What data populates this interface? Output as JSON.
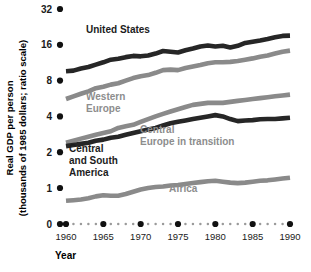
{
  "chart_data": {
    "type": "line",
    "title": "",
    "xlabel": "Year",
    "ylabel": "Real GDP per person (thousands of 1985 dollars; ratio scale)",
    "ylabel_line1": "Real GDP per person",
    "ylabel_line2": "(thousands of 1985 dollars; ratio scale)",
    "scale": "log2 (ratio scale)",
    "grid": false,
    "legend": "inline series labels",
    "xlim": [
      1960,
      1990
    ],
    "xticks": [
      1960,
      1965,
      1970,
      1975,
      1980,
      1985,
      1990
    ],
    "xticklabels": [
      "1960",
      "1965",
      "1970",
      "1975",
      "1980",
      "1985",
      "1990"
    ],
    "yticks": [
      0,
      1,
      2,
      4,
      8,
      16,
      32
    ],
    "yticklabels": [
      "0",
      "1",
      "2",
      "4",
      "8",
      "16",
      "32"
    ],
    "ylim": [
      0,
      32
    ],
    "x": [
      1960,
      1961,
      1962,
      1963,
      1964,
      1965,
      1966,
      1967,
      1968,
      1969,
      1970,
      1971,
      1972,
      1973,
      1974,
      1975,
      1976,
      1977,
      1978,
      1979,
      1980,
      1981,
      1982,
      1983,
      1984,
      1985,
      1986,
      1987,
      1988,
      1989,
      1990
    ],
    "series": [
      {
        "name": "United States",
        "color": "#262626",
        "label_color": "dark",
        "values": [
          9.6,
          9.7,
          10.1,
          10.4,
          10.9,
          11.4,
          12.0,
          12.2,
          12.6,
          12.9,
          12.8,
          13.0,
          13.5,
          14.2,
          14.0,
          13.8,
          14.4,
          14.9,
          15.5,
          15.8,
          15.5,
          15.7,
          15.2,
          15.7,
          16.6,
          17.0,
          17.4,
          17.9,
          18.5,
          19.0,
          19.1
        ]
      },
      {
        "name": "Western Europe",
        "color": "#8a8a8a",
        "label_color": "gray",
        "values": [
          5.6,
          5.9,
          6.2,
          6.5,
          6.9,
          7.1,
          7.4,
          7.6,
          8.0,
          8.4,
          8.7,
          8.9,
          9.3,
          9.8,
          9.9,
          9.8,
          10.2,
          10.5,
          10.8,
          11.2,
          11.4,
          11.4,
          11.5,
          11.7,
          12.0,
          12.3,
          12.7,
          13.0,
          13.5,
          14.0,
          14.3
        ]
      },
      {
        "name": "Central Europe in transition",
        "color": "#8a8a8a",
        "label_color": "gray",
        "values": [
          2.4,
          2.5,
          2.6,
          2.7,
          2.8,
          2.9,
          3.0,
          3.2,
          3.3,
          3.4,
          3.6,
          3.8,
          4.0,
          4.2,
          4.4,
          4.6,
          4.8,
          5.0,
          5.1,
          5.2,
          5.2,
          5.2,
          5.3,
          5.4,
          5.5,
          5.6,
          5.7,
          5.8,
          5.9,
          6.0,
          6.1
        ]
      },
      {
        "name": "Central and South America",
        "color": "#262626",
        "label_color": "dark",
        "values": [
          2.25,
          2.3,
          2.35,
          2.4,
          2.5,
          2.55,
          2.65,
          2.7,
          2.8,
          2.9,
          3.0,
          3.1,
          3.2,
          3.35,
          3.5,
          3.6,
          3.7,
          3.8,
          3.9,
          4.0,
          4.1,
          4.0,
          3.8,
          3.65,
          3.7,
          3.72,
          3.78,
          3.8,
          3.8,
          3.85,
          3.9
        ]
      },
      {
        "name": "Africa",
        "color": "#8a8a8a",
        "label_color": "gray",
        "values": [
          0.78,
          0.79,
          0.8,
          0.82,
          0.85,
          0.87,
          0.86,
          0.86,
          0.89,
          0.93,
          0.97,
          1.0,
          1.02,
          1.03,
          1.05,
          1.06,
          1.08,
          1.1,
          1.12,
          1.14,
          1.15,
          1.13,
          1.11,
          1.1,
          1.11,
          1.13,
          1.15,
          1.16,
          1.18,
          1.2,
          1.22
        ]
      }
    ],
    "series_labels": [
      {
        "name": "United States",
        "lines": [
          "United States"
        ],
        "color": "dark",
        "x": 86,
        "y": 33
      },
      {
        "name": "Western Europe",
        "lines": [
          "Western",
          "Europe"
        ],
        "color": "gray",
        "x": 86,
        "y": 100
      },
      {
        "name": "Central Europe in transition",
        "lines": [
          "Central",
          "Europe in transition"
        ],
        "color": "gray",
        "x": 140,
        "y": 133
      },
      {
        "name": "Central and South America",
        "lines": [
          "Central",
          "and South",
          "America"
        ],
        "color": "dark",
        "x": 69,
        "y": 152
      },
      {
        "name": "Africa",
        "lines": [
          "Africa"
        ],
        "color": "gray",
        "x": 169,
        "y": 192
      }
    ]
  },
  "axis": {
    "x_title": "Year",
    "y_title_line1": "Real GDP per person",
    "y_title_line2": "(thousands of 1985 dollars; ratio scale)"
  }
}
